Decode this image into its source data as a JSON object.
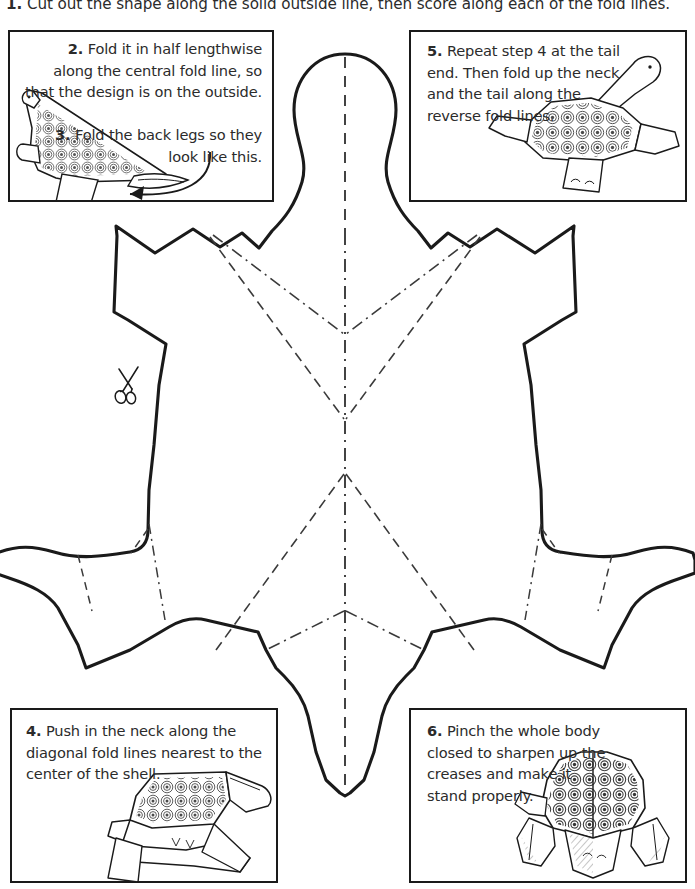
{
  "page": {
    "width": 695,
    "height": 889,
    "background_color": "#ffffff",
    "ink_color": "#1a1a1a"
  },
  "steps": {
    "step1": {
      "number": "1.",
      "text": "Cut out the shape along the solid outside line, then score along each of the fold lines."
    },
    "step2": {
      "number": "2.",
      "text": "Fold it in half lengthwise along the central fold line, so that the design is on the outside."
    },
    "step3": {
      "number": "3.",
      "text": "Fold the back legs so they look like this."
    },
    "step4": {
      "number": "4.",
      "text": "Push in the neck along the diagonal fold lines nearest to the center of the shell."
    },
    "step5": {
      "number": "5.",
      "text": "Repeat step 4 at the tail end. Then fold up the neck and the tail along the reverse fold lines."
    },
    "step6": {
      "number": "6.",
      "text": "Pinch the whole body closed to sharpen up the creases and make it stand properly."
    }
  },
  "legend": {
    "cut_line": "solid outside line",
    "fold_line": "dashed fold line",
    "reverse_fold_line": "dash-dot reverse fold line",
    "central_fold_line": "central fold line"
  },
  "icons": {
    "scissors": "scissors-icon"
  },
  "colors": {
    "ink": "#1a1a1a",
    "text": "#2b2b2b",
    "paper": "#ffffff",
    "shell_pattern": "#4a4a4a"
  }
}
